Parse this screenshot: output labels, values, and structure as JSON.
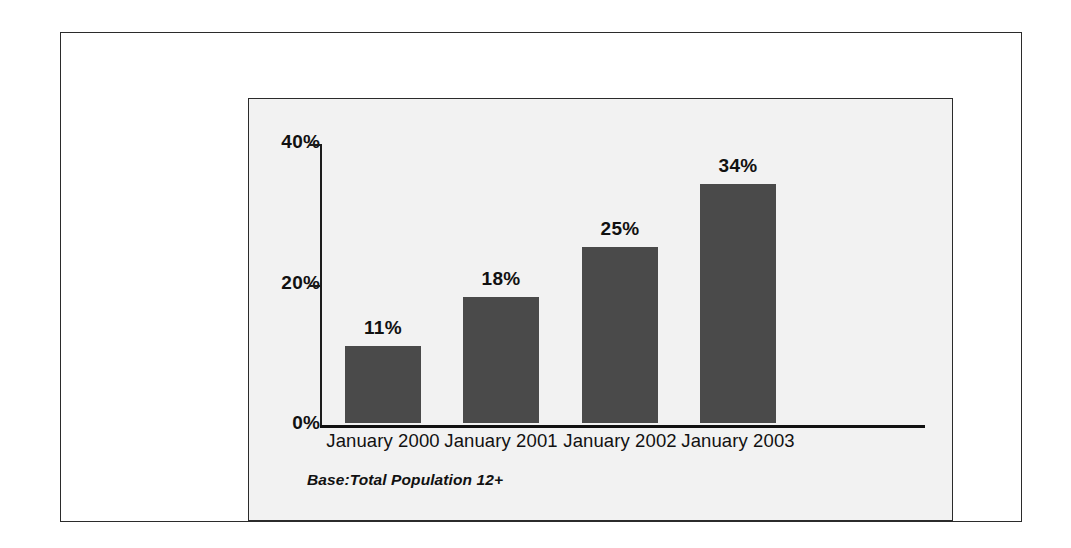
{
  "chart_data": {
    "type": "bar",
    "title": "",
    "xlabel": "",
    "ylabel": "",
    "categories": [
      "January 2000",
      "January 2001",
      "January 2002",
      "January 2003"
    ],
    "values": [
      11,
      18,
      25,
      34
    ],
    "value_labels": [
      "11%",
      "18%",
      "25%",
      "34%"
    ],
    "ylim": [
      0,
      40
    ],
    "ytick_values": [
      0,
      20,
      40
    ],
    "ytick_labels": [
      "0%",
      "20%",
      "40%"
    ],
    "grid": false,
    "legend": null,
    "annotations": [
      "Base:Total Population 12+"
    ],
    "bar_color": "#4a4a4a",
    "axis_color": "#111111",
    "panel_background": "#f2f2f2",
    "page_background": "#ffffff"
  },
  "footnote": "Base:Total Population 12+"
}
